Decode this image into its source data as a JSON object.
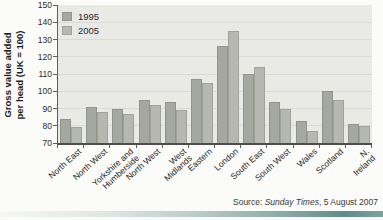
{
  "figure": {
    "y_axis_title_line1": "Gross value added",
    "y_axis_title_line2": "per head (UK = 100)",
    "source": {
      "prefix": "Source: ",
      "publication": "Sunday Times",
      "suffix": ", 5 August 2007"
    }
  },
  "chart_data": {
    "type": "bar",
    "title": "",
    "xlabel": "",
    "ylabel": "Gross value added per head (UK = 100)",
    "ylim": [
      70,
      150
    ],
    "ytick_step": 10,
    "grid": true,
    "legend_position": "top-left",
    "categories": [
      "North East",
      "North West",
      "Yorkshire and\nHumberside",
      "North West",
      "West\nMidlands",
      "Eastern",
      "London",
      "South East",
      "South West",
      "Wales",
      "Scotland",
      "N. Ireland"
    ],
    "series": [
      {
        "name": "1995",
        "color": "#a5a8a0",
        "values": [
          84,
          91,
          90,
          95,
          94,
          107,
          126,
          110,
          94,
          83,
          100,
          81
        ]
      },
      {
        "name": "2005",
        "color": "#b6b7b0",
        "values": [
          79,
          88,
          87,
          92,
          89,
          105,
          135,
          114,
          90,
          77,
          95,
          80
        ]
      }
    ]
  }
}
